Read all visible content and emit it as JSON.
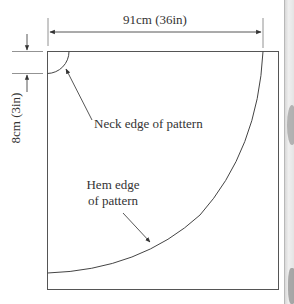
{
  "diagram": {
    "labels": {
      "width_dimension": "91cm (36in)",
      "neck_offset_dimension": "8cm (3in)",
      "neck_edge": "Neck edge of pattern",
      "hem_edge_line1": "Hem edge",
      "hem_edge_line2": "of pattern"
    },
    "colors": {
      "line": "#555555",
      "text": "#333333",
      "background": "#ffffff",
      "side_strip": "#e4e4e4"
    }
  }
}
